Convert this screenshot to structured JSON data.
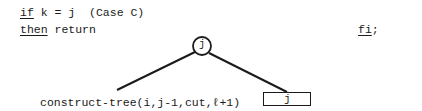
{
  "code": {
    "line1": {
      "keyword": "if",
      "expression": " k = j",
      "comment": "(Case C)"
    },
    "line2": {
      "keyword": "then",
      "statement": " return"
    },
    "end": {
      "keyword": "fi",
      "terminator": ";"
    }
  },
  "tree": {
    "root_node": {
      "label": "j",
      "shape": "circle"
    },
    "left_child": {
      "label": "construct-tree(i,j-1,cut,ℓ+1)",
      "shape": "text"
    },
    "right_child": {
      "label": "j",
      "shape": "rectangle"
    }
  },
  "colors": {
    "ink": "#1a1a1a",
    "background": "#ffffff"
  }
}
